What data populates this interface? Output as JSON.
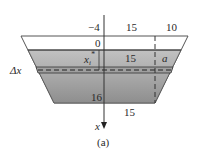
{
  "diagram": {
    "caption": "(a)",
    "top_labels": {
      "left_offset": "−4",
      "middle_width": "15",
      "right_width": "10"
    },
    "surface_label": "0",
    "depth_label": "x",
    "depth_sub": "i",
    "depth_sup": "*",
    "strip_width_label": "15",
    "side_label": "a",
    "thickness_label": "Δx",
    "bottom_depth_label": "16",
    "bottom_width_label": "15",
    "axis_label": "x",
    "colors": {
      "water_top": "#b9b9b9",
      "water_bottom": "#8f8f8f",
      "outline": "#444444",
      "background": "#ffffff"
    }
  }
}
